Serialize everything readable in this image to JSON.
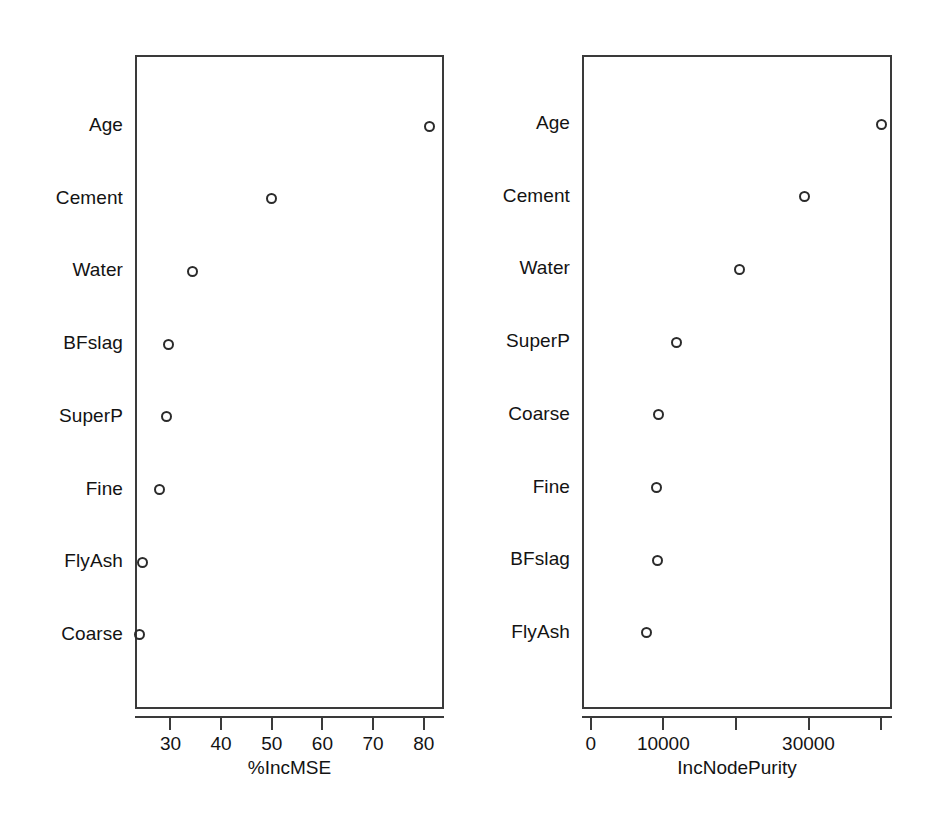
{
  "figure": {
    "type": "variable-importance-dotchart",
    "panels": 2
  },
  "chart_data": [
    {
      "type": "scatter",
      "title": "",
      "xlabel": "%IncMSE",
      "ylabel": "",
      "categories": [
        "Age",
        "Cement",
        "Water",
        "BFslag",
        "SuperP",
        "Fine",
        "FlyAsh",
        "Coarse"
      ],
      "values": [
        81.2,
        50.0,
        34.3,
        29.6,
        29.2,
        27.8,
        24.5,
        23.9
      ],
      "xticks": [
        30,
        40,
        50,
        60,
        70,
        80
      ],
      "xticklabels": [
        "30",
        "40",
        "50",
        "60",
        "70",
        "80"
      ],
      "xlim": [
        23.0,
        84.0
      ],
      "grid": false,
      "legend": false,
      "marker": "open-circle"
    },
    {
      "type": "scatter",
      "title": "",
      "xlabel": "IncNodePurity",
      "ylabel": "",
      "categories": [
        "Age",
        "Cement",
        "Water",
        "SuperP",
        "Coarse",
        "Fine",
        "BFslag",
        "FlyAsh"
      ],
      "values": [
        40000,
        29500,
        20500,
        11800,
        9400,
        9000,
        9200,
        7700
      ],
      "xticks": [
        0,
        10000,
        20000,
        30000,
        40000
      ],
      "xticklabels": [
        "0",
        "10000",
        "",
        "30000",
        ""
      ],
      "xlim": [
        -1200,
        41500
      ],
      "grid": false,
      "legend": false,
      "marker": "open-circle"
    }
  ],
  "left_panel": {
    "axis_title": "%IncMSE",
    "tick_labels": [
      "30",
      "40",
      "50",
      "60",
      "70",
      "80"
    ],
    "rows": [
      {
        "label": "Age",
        "value": 81.2
      },
      {
        "label": "Cement",
        "value": 50.0
      },
      {
        "label": "Water",
        "value": 34.3
      },
      {
        "label": "BFslag",
        "value": 29.6
      },
      {
        "label": "SuperP",
        "value": 29.2
      },
      {
        "label": "Fine",
        "value": 27.8
      },
      {
        "label": "FlyAsh",
        "value": 24.5
      },
      {
        "label": "Coarse",
        "value": 23.9
      }
    ]
  },
  "right_panel": {
    "axis_title": "IncNodePurity",
    "tick_labels": [
      "0",
      "10000",
      "",
      "30000",
      ""
    ],
    "rows": [
      {
        "label": "Age",
        "value": 40000
      },
      {
        "label": "Cement",
        "value": 29500
      },
      {
        "label": "Water",
        "value": 20500
      },
      {
        "label": "SuperP",
        "value": 11800
      },
      {
        "label": "Coarse",
        "value": 9400
      },
      {
        "label": "Fine",
        "value": 9000
      },
      {
        "label": "BFslag",
        "value": 9200
      },
      {
        "label": "FlyAsh",
        "value": 7700
      }
    ]
  },
  "style": {
    "marker_color": "#2b2b2b",
    "axis_color": "#3a3a3a",
    "text_color": "#131313",
    "background": "#ffffff"
  }
}
